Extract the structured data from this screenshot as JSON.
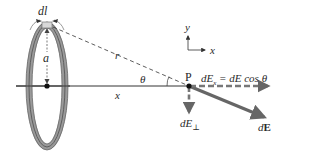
{
  "diagram": {
    "labels": {
      "dl": "dl",
      "a": "a",
      "r": "r",
      "theta": "θ",
      "x": "x",
      "P": "P",
      "dEx_eq": "dEx = dE cos θ",
      "dEx_lhs": "dE",
      "dEx_sub": "x",
      "dEx_rhs": " = dE cos θ",
      "dEperp": "dE",
      "dEperp_sub": "⊥",
      "dE_prefix": "d",
      "dE_vec": "E",
      "axis_y": "y",
      "axis_x": "x"
    },
    "colors": {
      "ring": "#8c8c8c",
      "ring_dark": "#5a5a5a",
      "line": "#333333",
      "arrow": "#666666",
      "dashed": "#444444",
      "text": "#2a2a2a"
    }
  }
}
